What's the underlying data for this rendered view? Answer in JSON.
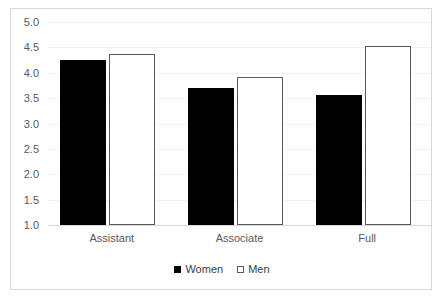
{
  "chart_data": {
    "type": "bar",
    "title": "",
    "subtitle": "",
    "xlabel": "",
    "ylabel": "",
    "categories": [
      "Assistant",
      "Associate",
      "Full"
    ],
    "series": [
      {
        "name": "Women",
        "values": [
          4.25,
          3.7,
          3.57
        ],
        "color": "#000000",
        "fill": "solid"
      },
      {
        "name": "Men",
        "values": [
          4.37,
          3.92,
          4.52
        ],
        "color": "#ffffff",
        "fill": "hollow"
      }
    ],
    "ylim": [
      1.0,
      5.0
    ],
    "ytick_labels": [
      "5.0",
      "4.5",
      "4.0",
      "3.5",
      "3.0",
      "2.5",
      "2.0",
      "1.5",
      "1.0"
    ],
    "ytick_values": [
      5.0,
      4.5,
      4.0,
      3.5,
      3.0,
      2.5,
      2.0,
      1.5,
      1.0
    ],
    "grid": true,
    "legend_position": "bottom",
    "legend_entries": [
      "Women",
      "Men"
    ],
    "annotations": []
  },
  "colors": {
    "women_bar": "#000000",
    "men_bar_fill": "#ffffff",
    "men_bar_border": "#595959",
    "gridline": "#f2f2f2",
    "axis": "#d9d9d9",
    "frame": "#d9d9d9",
    "tick_text": "#595959",
    "legend_text": "#404040",
    "background": "#ffffff"
  }
}
